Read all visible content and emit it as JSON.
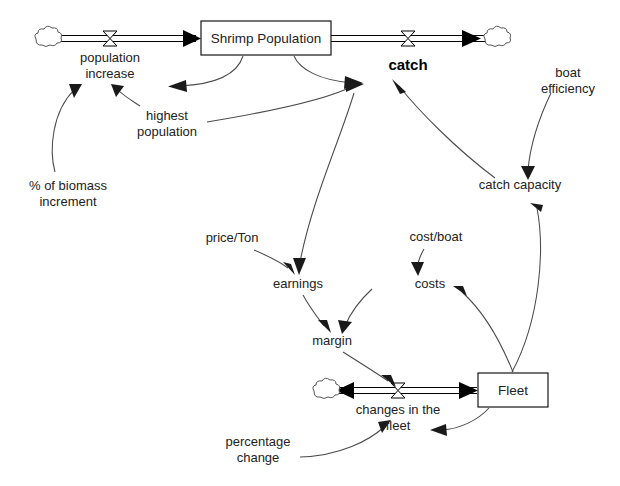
{
  "diagram": {
    "background_color": "#ffffff",
    "line_color": "#000000",
    "link_color": "#4a4a4a",
    "text_color": "#222222"
  },
  "stocks": [
    {
      "id": "shrimp_population",
      "label": "Shrimp Population",
      "x": 201,
      "y": 21,
      "w": 130,
      "h": 34
    },
    {
      "id": "fleet",
      "label": "Fleet",
      "x": 478,
      "y": 373,
      "w": 70,
      "h": 34
    }
  ],
  "flows": [
    {
      "id": "population_increase",
      "label": "population increase",
      "line1": "population",
      "line2": "increase",
      "bold": false,
      "valve_x": 110,
      "valve_y": 38
    },
    {
      "id": "catch",
      "label": "catch",
      "line1": "catch",
      "line2": "",
      "bold": true,
      "valve_x": 408,
      "valve_y": 38
    },
    {
      "id": "changes_in_the_fleet",
      "label": "changes in the fleet",
      "line1": "changes in the",
      "line2": "fleet",
      "bold": false,
      "valve_x": 398,
      "valve_y": 390
    }
  ],
  "clouds": [
    {
      "id": "source-cloud-population",
      "x": 45,
      "y": 39
    },
    {
      "id": "sink-cloud-catch",
      "x": 494,
      "y": 39
    },
    {
      "id": "sink-cloud-fleet",
      "x": 323,
      "y": 391
    }
  ],
  "variables": [
    {
      "id": "highest_population",
      "line1": "highest",
      "line2": "population",
      "cx": 167,
      "cy": 120
    },
    {
      "id": "pct_biomass_increment",
      "line1": "% of biomass",
      "line2": "increment",
      "cx": 68,
      "cy": 190
    },
    {
      "id": "boat_efficiency",
      "line1": "boat",
      "line2": "efficiency",
      "cx": 565,
      "cy": 77
    },
    {
      "id": "catch_capacity",
      "line1": "catch capacity",
      "line2": "",
      "cx": 520,
      "cy": 189
    },
    {
      "id": "price_per_ton",
      "line1": "price/Ton",
      "line2": "",
      "cx": 234,
      "cy": 242
    },
    {
      "id": "cost_per_boat",
      "line1": "cost/boat",
      "line2": "",
      "cx": 436,
      "cy": 241
    },
    {
      "id": "earnings",
      "line1": "earnings",
      "line2": "",
      "cx": 298,
      "cy": 288
    },
    {
      "id": "costs",
      "line1": "costs",
      "line2": "",
      "cx": 430,
      "cy": 288
    },
    {
      "id": "margin",
      "line1": "margin",
      "line2": "",
      "cx": 332,
      "cy": 345
    },
    {
      "id": "percentage_change",
      "line1": "percentage",
      "line2": "change",
      "cx": 258,
      "cy": 446
    }
  ],
  "links": [
    {
      "id": "link-shrimp-to-population-increase",
      "from": "shrimp_population",
      "to": "population_increase"
    },
    {
      "id": "link-pct-biomass-to-population-increase",
      "from": "pct_biomass_increment",
      "to": "population_increase"
    },
    {
      "id": "link-highest-population-to-population-increase",
      "from": "highest_population",
      "to": "population_increase"
    },
    {
      "id": "link-shrimp-to-catch",
      "from": "shrimp_population",
      "to": "catch"
    },
    {
      "id": "link-highest-population-to-catch",
      "from": "highest_population",
      "to": "catch"
    },
    {
      "id": "link-catch-capacity-to-catch",
      "from": "catch_capacity",
      "to": "catch"
    },
    {
      "id": "link-boat-efficiency-to-catch-capacity",
      "from": "boat_efficiency",
      "to": "catch_capacity"
    },
    {
      "id": "link-fleet-to-catch-capacity",
      "from": "fleet",
      "to": "catch_capacity"
    },
    {
      "id": "link-catch-to-earnings",
      "from": "catch",
      "to": "earnings"
    },
    {
      "id": "link-price-to-earnings",
      "from": "price_per_ton",
      "to": "earnings"
    },
    {
      "id": "link-cost-per-boat-to-costs",
      "from": "cost_per_boat",
      "to": "costs"
    },
    {
      "id": "link-fleet-to-costs",
      "from": "fleet",
      "to": "costs"
    },
    {
      "id": "link-earnings-to-margin",
      "from": "earnings",
      "to": "margin"
    },
    {
      "id": "link-costs-to-margin",
      "from": "costs",
      "to": "margin"
    },
    {
      "id": "link-margin-to-changes-in-fleet",
      "from": "margin",
      "to": "changes_in_the_fleet"
    },
    {
      "id": "link-percentage-change-to-changes-in-fleet",
      "from": "percentage_change",
      "to": "changes_in_the_fleet"
    },
    {
      "id": "link-fleet-to-changes-in-fleet",
      "from": "fleet",
      "to": "changes_in_the_fleet"
    }
  ]
}
